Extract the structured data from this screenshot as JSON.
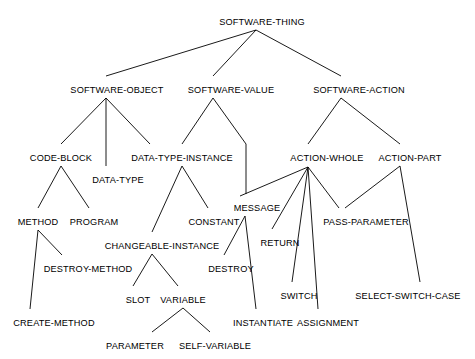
{
  "diagram": {
    "type": "tree-taxonomy",
    "title_node": "SOFTWARE-THING",
    "background_color": "#ffffff",
    "line_color": "#000000",
    "text_color": "#000000",
    "nodes": [
      {
        "id": "software-thing",
        "label": "SOFTWARE-THING",
        "x": 262,
        "y": 17,
        "anchor_x": 256,
        "anchor_y": 29
      },
      {
        "id": "software-object",
        "label": "SOFTWARE-OBJECT",
        "x": 117,
        "y": 85,
        "anchor_x": 106,
        "anchor_y": 97
      },
      {
        "id": "software-value",
        "label": "SOFTWARE-VALUE",
        "x": 231,
        "y": 85,
        "anchor_x": 213,
        "anchor_y": 97
      },
      {
        "id": "software-action",
        "label": "SOFTWARE-ACTION",
        "x": 359,
        "y": 85,
        "anchor_x": 341,
        "anchor_y": 97
      },
      {
        "id": "code-block",
        "label": "CODE-BLOCK",
        "x": 61,
        "y": 153,
        "anchor_x": 61,
        "anchor_y": 165
      },
      {
        "id": "data-type",
        "label": "DATA-TYPE",
        "x": 118,
        "y": 175,
        "anchor_x": 106,
        "anchor_y": 169
      },
      {
        "id": "data-type-instance",
        "label": "DATA-TYPE-INSTANCE",
        "x": 182,
        "y": 153,
        "anchor_x": 182,
        "anchor_y": 165
      },
      {
        "id": "action-whole",
        "label": "ACTION-WHOLE",
        "x": 327,
        "y": 153,
        "anchor_x": 308,
        "anchor_y": 166
      },
      {
        "id": "action-part",
        "label": "ACTION-PART",
        "x": 410,
        "y": 153,
        "anchor_x": 400,
        "anchor_y": 165
      },
      {
        "id": "method",
        "label": "METHOD",
        "x": 38,
        "y": 217,
        "anchor_x": 38,
        "anchor_y": 229
      },
      {
        "id": "program",
        "label": "PROGRAM",
        "x": 94,
        "y": 217,
        "anchor_x": 89,
        "anchor_y": 211
      },
      {
        "id": "constant",
        "label": "CONSTANT",
        "x": 214,
        "y": 217,
        "anchor_x": 207,
        "anchor_y": 211
      },
      {
        "id": "message",
        "label": "MESSAGE",
        "x": 257,
        "y": 203,
        "anchor_x": 245,
        "anchor_y": 215
      },
      {
        "id": "pass-parameter",
        "label": "PASS-PARAMETER",
        "x": 366,
        "y": 217,
        "anchor_x": 339,
        "anchor_y": 211
      },
      {
        "id": "changeable-instance",
        "label": "CHANGEABLE-INSTANCE",
        "x": 162,
        "y": 241,
        "anchor_x": 152,
        "anchor_y": 253
      },
      {
        "id": "return",
        "label": "RETURN",
        "x": 280,
        "y": 238,
        "anchor_x": 272,
        "anchor_y": 232
      },
      {
        "id": "destroy-method",
        "label": "DESTROY-METHOD",
        "x": 88,
        "y": 264,
        "anchor_x": 59,
        "anchor_y": 258
      },
      {
        "id": "destroy",
        "label": "DESTROY",
        "x": 231,
        "y": 264,
        "anchor_x": 222,
        "anchor_y": 258
      },
      {
        "id": "switch",
        "label": "SWITCH",
        "x": 299,
        "y": 291,
        "anchor_x": 292,
        "anchor_y": 285
      },
      {
        "id": "select-switch-case",
        "label": "SELECT-SWITCH-CASE",
        "x": 408,
        "y": 291,
        "anchor_x": 408,
        "anchor_y": 285
      },
      {
        "id": "slot",
        "label": "SLOT",
        "x": 138,
        "y": 295,
        "anchor_x": 133,
        "anchor_y": 289
      },
      {
        "id": "variable",
        "label": "VARIABLE",
        "x": 183,
        "y": 295,
        "anchor_x": 183,
        "anchor_y": 307
      },
      {
        "id": "instantiate",
        "label": "INSTANTIATE",
        "x": 263,
        "y": 318,
        "anchor_x": 253,
        "anchor_y": 312
      },
      {
        "id": "assignment",
        "label": "ASSIGNMENT",
        "x": 328,
        "y": 318,
        "anchor_x": 318,
        "anchor_y": 312
      },
      {
        "id": "create-method",
        "label": "CREATE-METHOD",
        "x": 54,
        "y": 318,
        "anchor_x": 36,
        "anchor_y": 312
      },
      {
        "id": "parameter",
        "label": "PARAMETER",
        "x": 135,
        "y": 341,
        "anchor_x": 141,
        "anchor_y": 335
      },
      {
        "id": "self-variable",
        "label": "SELF-VARIABLE",
        "x": 215,
        "y": 341,
        "anchor_x": 205,
        "anchor_y": 335
      }
    ],
    "edges": [
      {
        "from": "software-thing",
        "to": "software-object",
        "x1": 256,
        "y1": 30,
        "x2": 106,
        "y2": 76
      },
      {
        "from": "software-thing",
        "to": "software-value",
        "x1": 256,
        "y1": 30,
        "x2": 213,
        "y2": 76
      },
      {
        "from": "software-thing",
        "to": "software-action",
        "x1": 256,
        "y1": 30,
        "x2": 341,
        "y2": 76
      },
      {
        "from": "software-object",
        "to": "code-block",
        "x1": 106,
        "y1": 98,
        "x2": 61,
        "y2": 144
      },
      {
        "from": "software-object",
        "to": "data-type",
        "x1": 106,
        "y1": 98,
        "x2": 106,
        "y2": 166
      },
      {
        "from": "software-object",
        "to": "data-type-instance",
        "x1": 106,
        "y1": 98,
        "x2": 150,
        "y2": 144
      },
      {
        "from": "software-value",
        "to": "data-type-instance",
        "x1": 213,
        "y1": 98,
        "x2": 182,
        "y2": 144
      },
      {
        "from": "software-value",
        "to": "message",
        "x1": 213,
        "y1": 98,
        "x2": 246,
        "y2": 144
      },
      {
        "from": "software-action",
        "to": "action-whole",
        "x1": 341,
        "y1": 98,
        "x2": 308,
        "y2": 144
      },
      {
        "from": "software-action",
        "to": "action-part",
        "x1": 341,
        "y1": 98,
        "x2": 400,
        "y2": 144
      },
      {
        "from": "code-block",
        "to": "method",
        "x1": 61,
        "y1": 166,
        "x2": 38,
        "y2": 208
      },
      {
        "from": "code-block",
        "to": "program",
        "x1": 61,
        "y1": 166,
        "x2": 89,
        "y2": 208
      },
      {
        "from": "data-type-instance",
        "to": "changeable-instance",
        "x1": 182,
        "y1": 166,
        "x2": 152,
        "y2": 232
      },
      {
        "from": "data-type-instance",
        "to": "constant",
        "x1": 182,
        "y1": 166,
        "x2": 208,
        "y2": 208
      },
      {
        "from": "message-branch",
        "to": "message",
        "x1": 246,
        "y1": 144,
        "x2": 246,
        "y2": 194
      },
      {
        "from": "action-whole",
        "to": "message",
        "x1": 308,
        "y1": 167,
        "x2": 240,
        "y2": 196
      },
      {
        "from": "action-whole",
        "to": "return",
        "x1": 308,
        "y1": 167,
        "x2": 272,
        "y2": 229
      },
      {
        "from": "action-whole",
        "to": "switch",
        "x1": 308,
        "y1": 167,
        "x2": 292,
        "y2": 282
      },
      {
        "from": "action-whole",
        "to": "assignment",
        "x1": 308,
        "y1": 167,
        "x2": 318,
        "y2": 309
      },
      {
        "from": "action-whole",
        "to": "pass-parameter",
        "x1": 308,
        "y1": 167,
        "x2": 339,
        "y2": 208
      },
      {
        "from": "action-part",
        "to": "pass-parameter",
        "x1": 400,
        "y1": 166,
        "x2": 345,
        "y2": 208
      },
      {
        "from": "action-part",
        "to": "select-switch-case",
        "x1": 400,
        "y1": 166,
        "x2": 420,
        "y2": 282
      },
      {
        "from": "method",
        "to": "create-method",
        "x1": 38,
        "y1": 230,
        "x2": 30,
        "y2": 309
      },
      {
        "from": "method",
        "to": "destroy-method",
        "x1": 38,
        "y1": 230,
        "x2": 62,
        "y2": 255
      },
      {
        "from": "changeable-instance",
        "to": "slot",
        "x1": 152,
        "y1": 254,
        "x2": 133,
        "y2": 286
      },
      {
        "from": "changeable-instance",
        "to": "variable",
        "x1": 152,
        "y1": 254,
        "x2": 178,
        "y2": 286
      },
      {
        "from": "variable",
        "to": "parameter",
        "x1": 183,
        "y1": 308,
        "x2": 152,
        "y2": 332
      },
      {
        "from": "variable",
        "to": "self-variable",
        "x1": 183,
        "y1": 308,
        "x2": 210,
        "y2": 332
      },
      {
        "from": "message",
        "to": "destroy",
        "x1": 245,
        "y1": 216,
        "x2": 224,
        "y2": 255
      },
      {
        "from": "message",
        "to": "instantiate",
        "x1": 245,
        "y1": 216,
        "x2": 256,
        "y2": 309
      }
    ]
  }
}
